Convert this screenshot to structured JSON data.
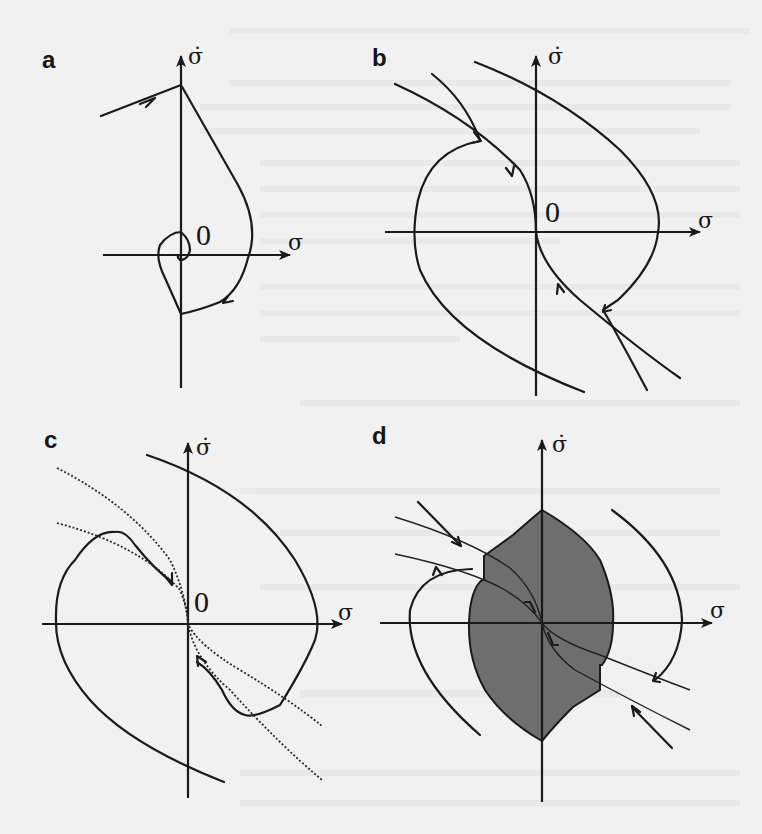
{
  "figure": {
    "panels": [
      {
        "id": "a",
        "label": "a",
        "x_axis_label": "σ",
        "y_axis_label": "σ̇",
        "origin_label": "0"
      },
      {
        "id": "b",
        "label": "b",
        "x_axis_label": "σ",
        "y_axis_label": "σ̇",
        "origin_label": "0"
      },
      {
        "id": "c",
        "label": "c",
        "x_axis_label": "σ",
        "y_axis_label": "σ̇",
        "origin_label": "0"
      },
      {
        "id": "d",
        "label": "d",
        "x_axis_label": "σ",
        "y_axis_label": "σ̇",
        "origin_label": ""
      }
    ],
    "colors": {
      "ink": "#1a1a1a",
      "background": "#f1f1f1",
      "shaded_region": "#6e6e6e"
    }
  }
}
